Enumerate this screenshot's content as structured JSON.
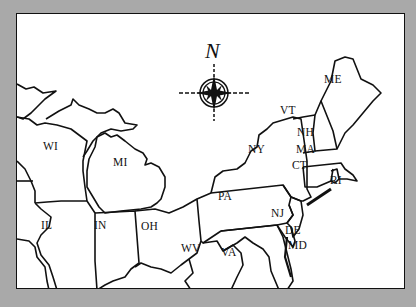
{
  "map": {
    "title": "Northeastern United States",
    "colors": {
      "background": "#a9a9a9",
      "land": "#ffffff",
      "outline": "#111111"
    },
    "compass": {
      "north_label": "N",
      "icon": "compass-rose-icon"
    },
    "states": [
      {
        "code": "WI",
        "name": "Wisconsin",
        "x": 42,
        "y": 146
      },
      {
        "code": "MI",
        "name": "Michigan",
        "x": 112,
        "y": 162
      },
      {
        "code": "IL",
        "name": "Illinois",
        "x": 40,
        "y": 225
      },
      {
        "code": "IN",
        "name": "Indiana",
        "x": 93,
        "y": 225
      },
      {
        "code": "OH",
        "name": "Ohio",
        "x": 140,
        "y": 226
      },
      {
        "code": "PA",
        "name": "Pennsylvania",
        "x": 217,
        "y": 196
      },
      {
        "code": "NY",
        "name": "New York",
        "x": 247,
        "y": 149
      },
      {
        "code": "VT",
        "name": "Vermont",
        "x": 279,
        "y": 110
      },
      {
        "code": "NH",
        "name": "New Hampshire",
        "x": 296,
        "y": 132
      },
      {
        "code": "ME",
        "name": "Maine",
        "x": 323,
        "y": 79
      },
      {
        "code": "MA",
        "name": "Massachusetts",
        "x": 295,
        "y": 149
      },
      {
        "code": "CT",
        "name": "Connecticut",
        "x": 291,
        "y": 165
      },
      {
        "code": "RI",
        "name": "Rhode Island",
        "x": 329,
        "y": 180
      },
      {
        "code": "NJ",
        "name": "New Jersey",
        "x": 270,
        "y": 213
      },
      {
        "code": "DE",
        "name": "Delaware",
        "x": 284,
        "y": 230
      },
      {
        "code": "MD",
        "name": "Maryland",
        "x": 287,
        "y": 245
      },
      {
        "code": "WV",
        "name": "West Virginia",
        "x": 180,
        "y": 248
      },
      {
        "code": "VA",
        "name": "Virginia",
        "x": 220,
        "y": 252
      }
    ]
  }
}
